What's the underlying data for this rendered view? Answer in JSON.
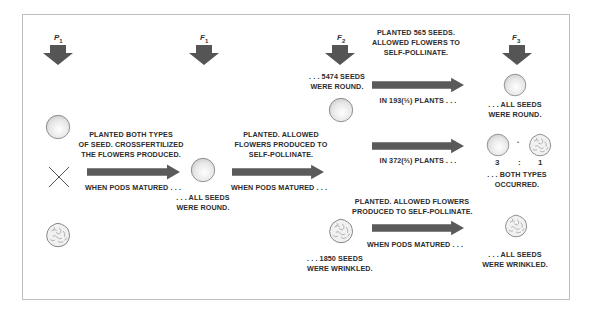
{
  "generations": [
    {
      "id": "P",
      "label": "P",
      "sub": "1"
    },
    {
      "id": "F1",
      "label": "F",
      "sub": "1"
    },
    {
      "id": "F2",
      "label": "F",
      "sub": "2"
    },
    {
      "id": "F3",
      "label": "F",
      "sub": "3"
    }
  ],
  "p1": {
    "cross_symbol": "×",
    "step_text": [
      "PLANTED BOTH TYPES",
      "OF SEED. CROSSFERTILIZED",
      "THE FLOWERS PRODUCED."
    ],
    "step_after": "WHEN PODS MATURED . . ."
  },
  "f1": {
    "result": [
      ". . . ALL SEEDS",
      "WERE ROUND."
    ],
    "step_text": [
      "PLANTED. ALLOWED",
      "FLOWERS PRODUCED TO",
      "SELF-POLLINATE."
    ],
    "step_after": "WHEN PODS MATURED . . ."
  },
  "f2": {
    "top_step": [
      "PLANTED 565 SEEDS.",
      "ALLOWED FLOWERS TO",
      "SELF-POLLINATE."
    ],
    "round_result": [
      ". . . 5474 SEEDS",
      "WERE ROUND."
    ],
    "branch1": "IN 193(⅓) PLANTS . . .",
    "branch2": "IN 372(⅔) PLANTS . . .",
    "wrinkled_step": [
      "PLANTED. ALLOWED FLOWERS",
      "PRODUCED TO SELF-POLLINATE."
    ],
    "wrinkled_after": "WHEN PODS MATURED . . .",
    "wrinkled_result": [
      ". . . 1850 SEEDS",
      "WERE WRINKLED."
    ]
  },
  "f3": {
    "round_result": [
      ". . . ALL SEEDS",
      "WERE ROUND."
    ],
    "ratio_left": "3",
    "ratio_sep": ":",
    "ratio_right": "1",
    "ratio_plus": "•",
    "mixed_result": [
      ". . . BOTH TYPES",
      "OCCURRED."
    ],
    "wrinkled_result": [
      ". . . ALL SEEDS",
      "WERE WRINKLED."
    ]
  },
  "colors": {
    "arrow": "#555555",
    "frame": "#bdbdbd",
    "text": "#2c2c2c"
  }
}
